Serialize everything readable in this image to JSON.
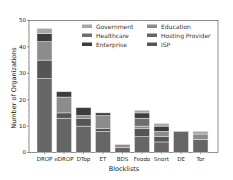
{
  "chart_data": {
    "type": "bar",
    "stacked": true,
    "title": "",
    "xlabel": "Blocklists",
    "ylabel": "Number of Organizations",
    "ylim": [
      0,
      50
    ],
    "yticks": [
      0,
      10,
      20,
      30,
      40,
      50
    ],
    "categories": [
      "DROP",
      "eDROP",
      "DTop",
      "ET",
      "BDS",
      "Feodo",
      "Snort",
      "DE",
      "Tor"
    ],
    "series": [
      {
        "name": "Hosting Provider",
        "color": "#666666",
        "values": [
          28,
          13,
          10,
          8,
          2,
          6,
          4,
          8,
          5
        ]
      },
      {
        "name": "ISP",
        "color": "#555555",
        "values": [
          7,
          2,
          3,
          1,
          0,
          3,
          2,
          0,
          0
        ]
      },
      {
        "name": "Education",
        "color": "#8c8c8c",
        "values": [
          7,
          6,
          1,
          5,
          1,
          1,
          2,
          0,
          2
        ]
      },
      {
        "name": "Healthcare",
        "color": "#6e6e6e",
        "values": [
          0,
          0,
          0,
          0,
          0,
          3,
          0,
          0,
          0
        ]
      },
      {
        "name": "Enterprise",
        "color": "#3c3c3c",
        "values": [
          3,
          2,
          3,
          1,
          0,
          2,
          2,
          0,
          0
        ]
      },
      {
        "name": "Government",
        "color": "#a6a6a6",
        "values": [
          2,
          0,
          0,
          0,
          0,
          1,
          1,
          0,
          1
        ]
      }
    ],
    "totals": [
      47,
      23,
      17,
      15,
      3,
      16,
      11,
      8,
      8
    ],
    "legend": {
      "position": "upper right",
      "columns": 2,
      "entries": [
        "Government",
        "Education",
        "Healthcare",
        "Hosting Provider",
        "Enterprise",
        "ISP"
      ]
    },
    "grid": false
  }
}
